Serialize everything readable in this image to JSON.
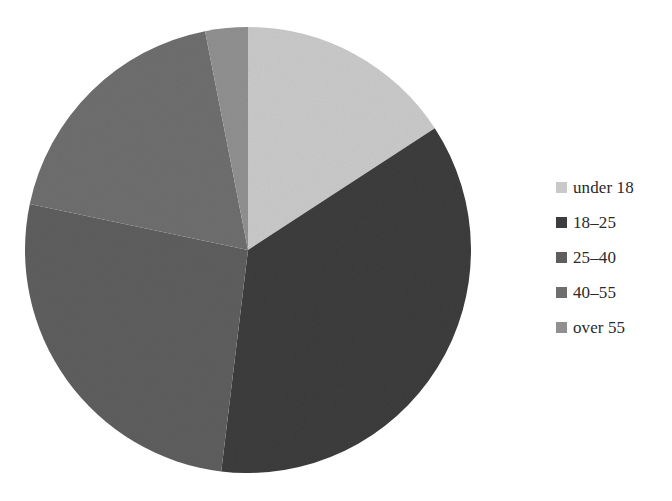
{
  "chart_data": {
    "type": "pie",
    "title": "",
    "labels": [
      "under 18",
      "18–25",
      "25–40",
      "40–55",
      "over 55"
    ],
    "values": [
      15.8,
      36.1,
      26.4,
      18.6,
      3.1
    ],
    "colors": [
      "#c9c9c9",
      "#3d3d3d",
      "#5e5e5e",
      "#6e6e6e",
      "#909090"
    ],
    "start_angle_deg": 0,
    "direction": "clockwise",
    "legend_position": "right",
    "grid": false,
    "slices": [
      {
        "label": "under 18",
        "value": 15.8,
        "color": "#c9c9c9",
        "start_deg": 0.0,
        "end_deg": 56.9
      },
      {
        "label": "18–25",
        "value": 36.1,
        "color": "#3d3d3d",
        "start_deg": 56.9,
        "end_deg": 186.9
      },
      {
        "label": "25–40",
        "value": 26.4,
        "color": "#5e5e5e",
        "start_deg": 186.9,
        "end_deg": 281.9
      },
      {
        "label": "40–55",
        "value": 18.6,
        "color": "#6e6e6e",
        "start_deg": 281.9,
        "end_deg": 348.9
      },
      {
        "label": "over 55",
        "value": 3.1,
        "color": "#909090",
        "start_deg": 348.9,
        "end_deg": 360.0
      }
    ]
  },
  "legend": {
    "items": [
      {
        "label": "under 18",
        "color": "#c9c9c9"
      },
      {
        "label": "18–25",
        "color": "#3d3d3d"
      },
      {
        "label": "25–40",
        "color": "#5e5e5e"
      },
      {
        "label": "40–55",
        "color": "#6e6e6e"
      },
      {
        "label": "over 55",
        "color": "#909090"
      }
    ]
  }
}
